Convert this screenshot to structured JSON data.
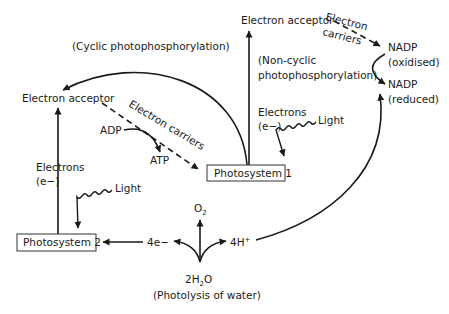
{
  "diagram": {
    "type": "flowchart",
    "nodes": {
      "ea_top": "Electron acceptor",
      "ea_left": "Electron acceptor",
      "ps1": "Photosystem 1",
      "ps2": "Photosystem 2",
      "nadp_ox_1": "NADP",
      "nadp_ox_2": "(oxidised)",
      "nadp_red_1": "NADP",
      "nadp_red_2": "(reduced)",
      "adp": "ADP",
      "atp": "ATP",
      "o2": "O",
      "o2_sub": "2",
      "e4": "4e−",
      "h4": "4H",
      "h4_sup": "+",
      "water_pre": "2H",
      "water_sub": "2",
      "water_post": "O",
      "photolysis": "(Photolysis of water)"
    },
    "labels": {
      "cyclic": "(Cyclic photophosphorylation)",
      "noncyclic_1": "(Non-cyclic",
      "noncyclic_2": "photophosphorylation)",
      "electrons_ps1_1": "Electrons",
      "electrons_ps1_2": "(e−)",
      "electrons_ps2_1": "Electrons",
      "electrons_ps2_2": "(e−)",
      "light_ps1": "Light",
      "light_ps2": "Light",
      "carriers_top_1": "Electron",
      "carriers_top_2": "carriers",
      "carriers_left": "Electron carriers"
    },
    "edges": [
      {
        "from": "Photosystem 1",
        "to": "Electron acceptor (top)",
        "label": "Electrons (e−)",
        "style": "solid"
      },
      {
        "from": "Electron acceptor (top)",
        "to": "NADP (oxidised)",
        "label": "Electron carriers",
        "style": "dashed"
      },
      {
        "from": "NADP (oxidised)",
        "to": "NADP (reduced)",
        "style": "solid"
      },
      {
        "from": "Photosystem 1",
        "to": "Electron acceptor (left)",
        "label": "(Cyclic photophosphorylation)",
        "style": "solid"
      },
      {
        "from": "Electron acceptor (left)",
        "to": "Photosystem 1",
        "label": "Electron carriers",
        "style": "dashed"
      },
      {
        "from": "ADP",
        "to": "ATP",
        "style": "solid"
      },
      {
        "from": "Photosystem 2",
        "to": "Electron acceptor (left)",
        "label": "Electrons (e−)",
        "style": "solid"
      },
      {
        "from": "Light",
        "to": "Photosystem 1",
        "style": "wavy"
      },
      {
        "from": "Light",
        "to": "Photosystem 2",
        "style": "wavy"
      },
      {
        "from": "2H2O",
        "to": "O2",
        "style": "solid"
      },
      {
        "from": "2H2O",
        "to": "4e−",
        "style": "solid"
      },
      {
        "from": "2H2O",
        "to": "4H+",
        "style": "solid"
      },
      {
        "from": "4e−",
        "to": "Photosystem 2",
        "style": "solid"
      },
      {
        "from": "4H+",
        "to": "NADP (reduced)",
        "style": "solid"
      }
    ]
  }
}
